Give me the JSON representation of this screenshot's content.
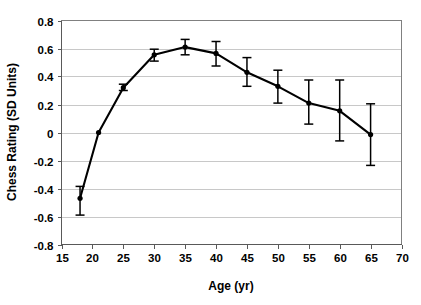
{
  "chart_data": {
    "type": "line",
    "title": "",
    "xlabel": "Age (yr)",
    "ylabel": "Chess Rating (SD Units)",
    "xlim": [
      15,
      70
    ],
    "ylim": [
      -0.8,
      0.8
    ],
    "xticks": [
      15,
      20,
      25,
      30,
      35,
      40,
      45,
      50,
      55,
      60,
      65,
      70
    ],
    "yticks": [
      -0.8,
      -0.6,
      -0.4,
      -0.2,
      0,
      0.2,
      0.4,
      0.6,
      0.8
    ],
    "xtick_labels": [
      "15",
      "20",
      "25",
      "30",
      "35",
      "40",
      "45",
      "50",
      "55",
      "60",
      "65",
      "70"
    ],
    "ytick_labels": [
      "0.8",
      "0.6",
      "0.4",
      "0.2",
      "0",
      "-0.2",
      "-0.4",
      "-0.6",
      "-0.8"
    ],
    "grid": "horizontal",
    "legend": "none",
    "x": [
      18,
      21,
      25,
      30,
      35,
      40,
      45,
      50,
      55,
      60,
      65
    ],
    "y": [
      -0.47,
      0.0,
      0.32,
      0.555,
      0.61,
      0.565,
      0.43,
      0.33,
      0.21,
      0.155,
      -0.015
    ],
    "yerr_low": [
      -0.59,
      0.0,
      0.3,
      0.51,
      0.555,
      0.475,
      0.33,
      0.21,
      0.06,
      -0.06,
      -0.235
    ],
    "yerr_high": [
      -0.385,
      0.0,
      0.345,
      0.595,
      0.665,
      0.65,
      0.535,
      0.445,
      0.375,
      0.375,
      0.205
    ],
    "series": [
      {
        "name": "Chess Rating",
        "values": [
          -0.47,
          0.0,
          0.32,
          0.555,
          0.61,
          0.565,
          0.43,
          0.33,
          0.21,
          0.155,
          -0.015
        ]
      }
    ],
    "colors": {
      "line": "#000000",
      "marker": "#000000",
      "grid": "#c8c8c8",
      "frame": "#808080",
      "background": "#ffffff"
    }
  }
}
